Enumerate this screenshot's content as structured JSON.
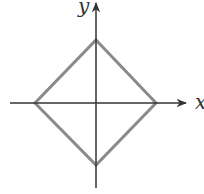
{
  "diagram": {
    "title": "",
    "axes": {
      "x_label": "x",
      "y_label": "y",
      "origin": [
        96,
        103
      ],
      "color": "#333333"
    },
    "shape": {
      "type": "diamond",
      "vertices": {
        "top": [
          96,
          40
        ],
        "right": [
          156,
          103
        ],
        "bottom": [
          96,
          165
        ],
        "left": [
          35,
          103
        ]
      },
      "stroke_color": "#8a8a8a"
    }
  }
}
